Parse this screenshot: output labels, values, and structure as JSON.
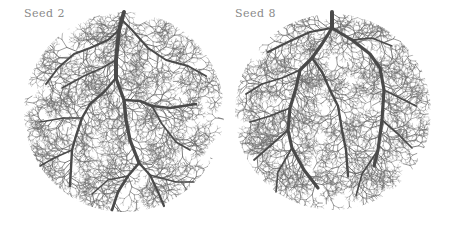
{
  "figure": {
    "background": "#ffffff",
    "vein_color": "#4a4a4a",
    "fine_color": "#6e6e6e",
    "label_color": "#8a8a8a",
    "panels": [
      {
        "label": "Seed 2",
        "label_pos": [
          24,
          7
        ],
        "circle": {
          "cx": 124,
          "cy": 112,
          "r": 100
        },
        "seed": 2,
        "main_veins": [
          {
            "w": 4.0,
            "pts": [
              [
                124,
                12
              ],
              [
                119,
                30
              ],
              [
                116,
                60
              ],
              [
                116,
                78
              ]
            ]
          },
          {
            "w": 3.4,
            "pts": [
              [
                116,
                78
              ],
              [
                121,
                92
              ],
              [
                124,
                100
              ],
              [
                126,
                120
              ],
              [
                130,
                140
              ],
              [
                139,
                163
              ]
            ]
          },
          {
            "w": 2.6,
            "pts": [
              [
                124,
                100
              ],
              [
                140,
                101
              ],
              [
                152,
                106
              ],
              [
                170,
                108
              ],
              [
                196,
                104
              ]
            ]
          },
          {
            "w": 2.6,
            "pts": [
              [
                139,
                163
              ],
              [
                128,
                176
              ],
              [
                118,
                192
              ],
              [
                112,
                210
              ]
            ]
          },
          {
            "w": 2.2,
            "pts": [
              [
                139,
                163
              ],
              [
                150,
                175
              ],
              [
                158,
                192
              ],
              [
                164,
                206
              ]
            ]
          },
          {
            "w": 2.4,
            "pts": [
              [
                116,
                78
              ],
              [
                104,
                92
              ],
              [
                90,
                104
              ],
              [
                82,
                118
              ],
              [
                76,
                136
              ],
              [
                72,
                150
              ],
              [
                70,
                186
              ]
            ]
          },
          {
            "w": 2.0,
            "pts": [
              [
                119,
                30
              ],
              [
                108,
                40
              ],
              [
                90,
                48
              ],
              [
                74,
                54
              ],
              [
                58,
                68
              ],
              [
                46,
                84
              ]
            ]
          },
          {
            "w": 2.0,
            "pts": [
              [
                120,
                18
              ],
              [
                132,
                30
              ],
              [
                148,
                48
              ],
              [
                166,
                60
              ],
              [
                188,
                66
              ],
              [
                206,
                76
              ]
            ]
          },
          {
            "w": 1.7,
            "pts": [
              [
                82,
                118
              ],
              [
                64,
                118
              ],
              [
                40,
                122
              ]
            ]
          },
          {
            "w": 1.6,
            "pts": [
              [
                116,
                60
              ],
              [
                102,
                68
              ],
              [
                84,
                76
              ],
              [
                62,
                88
              ]
            ]
          },
          {
            "w": 1.7,
            "pts": [
              [
                152,
                106
              ],
              [
                162,
                124
              ],
              [
                176,
                142
              ],
              [
                190,
                150
              ]
            ]
          },
          {
            "w": 1.6,
            "pts": [
              [
                72,
                150
              ],
              [
                54,
                158
              ],
              [
                40,
                166
              ]
            ]
          },
          {
            "w": 1.5,
            "pts": [
              [
                128,
                176
              ],
              [
                108,
                180
              ],
              [
                92,
                194
              ]
            ]
          },
          {
            "w": 1.5,
            "pts": [
              [
                150,
                175
              ],
              [
                176,
                182
              ],
              [
                194,
                182
              ]
            ]
          }
        ]
      },
      {
        "label": "Seed 8",
        "label_pos": [
          235,
          7
        ],
        "circle": {
          "cx": 333,
          "cy": 112,
          "r": 98
        },
        "seed": 8,
        "main_veins": [
          {
            "w": 4.0,
            "pts": [
              [
                332,
                12
              ],
              [
                332,
                28
              ]
            ]
          },
          {
            "w": 3.2,
            "pts": [
              [
                332,
                28
              ],
              [
                352,
                40
              ],
              [
                370,
                54
              ],
              [
                380,
                68
              ],
              [
                384,
                90
              ],
              [
                382,
                120
              ],
              [
                378,
                150
              ],
              [
                374,
                166
              ]
            ]
          },
          {
            "w": 3.2,
            "pts": [
              [
                332,
                28
              ],
              [
                322,
                44
              ],
              [
                312,
                58
              ],
              [
                300,
                70
              ],
              [
                296,
                88
              ],
              [
                290,
                108
              ],
              [
                288,
                130
              ],
              [
                292,
                148
              ],
              [
                304,
                170
              ],
              [
                318,
                188
              ]
            ]
          },
          {
            "w": 2.4,
            "pts": [
              [
                312,
                58
              ],
              [
                322,
                72
              ],
              [
                330,
                90
              ],
              [
                338,
                106
              ],
              [
                342,
                130
              ],
              [
                346,
                150
              ],
              [
                348,
                176
              ]
            ]
          },
          {
            "w": 2.0,
            "pts": [
              [
                332,
                28
              ],
              [
                310,
                32
              ],
              [
                288,
                42
              ],
              [
                268,
                52
              ]
            ]
          },
          {
            "w": 1.8,
            "pts": [
              [
                300,
                70
              ],
              [
                282,
                78
              ],
              [
                262,
                84
              ],
              [
                246,
                94
              ]
            ]
          },
          {
            "w": 1.8,
            "pts": [
              [
                290,
                108
              ],
              [
                270,
                116
              ],
              [
                250,
                122
              ]
            ]
          },
          {
            "w": 1.8,
            "pts": [
              [
                288,
                130
              ],
              [
                270,
                146
              ],
              [
                254,
                160
              ]
            ]
          },
          {
            "w": 1.7,
            "pts": [
              [
                384,
                90
              ],
              [
                400,
                98
              ],
              [
                416,
                106
              ]
            ]
          },
          {
            "w": 1.7,
            "pts": [
              [
                382,
                120
              ],
              [
                398,
                134
              ],
              [
                412,
                148
              ]
            ]
          },
          {
            "w": 1.6,
            "pts": [
              [
                378,
                150
              ],
              [
                362,
                174
              ],
              [
                356,
                196
              ]
            ]
          },
          {
            "w": 1.6,
            "pts": [
              [
                292,
                148
              ],
              [
                278,
                172
              ],
              [
                276,
                192
              ]
            ]
          },
          {
            "w": 1.5,
            "pts": [
              [
                352,
                40
              ],
              [
                372,
                38
              ],
              [
                392,
                46
              ]
            ]
          }
        ]
      }
    ]
  }
}
